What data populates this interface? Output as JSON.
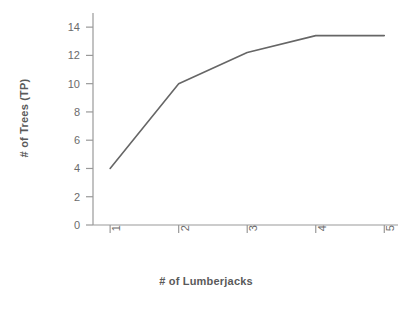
{
  "chart_data": {
    "type": "line",
    "title": "",
    "subtitle": "",
    "xlabel": "# of Lumberjacks",
    "ylabel": "# of Trees (TP)",
    "x": [
      1,
      2,
      3,
      4,
      5
    ],
    "values": [
      4.0,
      10.0,
      12.2,
      13.4,
      13.4
    ],
    "series": [
      {
        "name": "",
        "x": [
          1,
          2,
          3,
          4,
          5
        ],
        "values": [
          4.0,
          10.0,
          12.2,
          13.4,
          13.4
        ]
      }
    ],
    "xlim": [
      0.75,
      5.2
    ],
    "ylim": [
      0,
      15
    ],
    "xticks": [
      1,
      2,
      3,
      4,
      5
    ],
    "xticklabels": [
      "1",
      "2",
      "3",
      "4",
      "5"
    ],
    "yticks": [
      0,
      2,
      4,
      6,
      8,
      10,
      12,
      14
    ],
    "yticklabels": [
      "0",
      "2",
      "4",
      "6",
      "8",
      "10",
      "12",
      "14"
    ],
    "xtick_rotation": 90,
    "grid": false,
    "legend": false,
    "legend_position": "none",
    "line_color": "#666666",
    "line_width": 1.6,
    "markers": false,
    "axis_color": "#999999",
    "tick_label_color": "#6b6b6b",
    "axis_title_color": "#5a5a5a",
    "background_color": "#ffffff"
  }
}
